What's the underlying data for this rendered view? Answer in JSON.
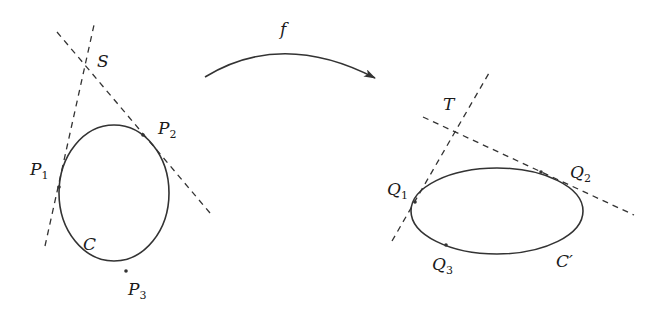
{
  "diagram": {
    "type": "projective-map-of-conics",
    "map_label": "f",
    "left": {
      "curve_label": "C",
      "intersection_label": "S",
      "points": [
        {
          "base": "P",
          "sub": "1"
        },
        {
          "base": "P",
          "sub": "2"
        },
        {
          "base": "P",
          "sub": "3"
        }
      ]
    },
    "right": {
      "curve_label": "C′",
      "intersection_label": "T",
      "points": [
        {
          "base": "Q",
          "sub": "1"
        },
        {
          "base": "Q",
          "sub": "2"
        },
        {
          "base": "Q",
          "sub": "3"
        }
      ]
    },
    "colors": {
      "stroke": "#333333",
      "text": "#1a1a1a",
      "background": "#ffffff"
    }
  }
}
